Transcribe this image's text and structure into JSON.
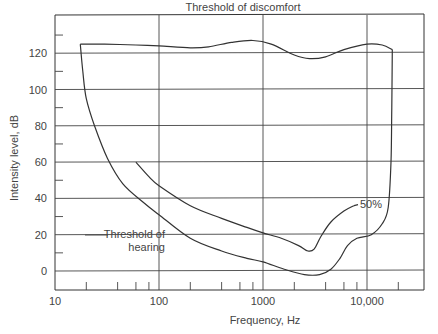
{
  "chart_data": {
    "type": "line",
    "title": "",
    "xlabel": "Frequency, Hz",
    "ylabel": "Intensity level, dB",
    "xscale": "log",
    "xlim": [
      10,
      35000
    ],
    "ylim": [
      -10,
      140
    ],
    "grid": true,
    "x_ticks": [
      {
        "value": 10,
        "label": "10"
      },
      {
        "value": 100,
        "label": "100"
      },
      {
        "value": 1000,
        "label": "1000"
      },
      {
        "value": 10000,
        "label": "10,000"
      }
    ],
    "x_minor_ticks": [
      20,
      40,
      60,
      80,
      200,
      400,
      600,
      800,
      2000,
      4000,
      6000,
      8000,
      20000
    ],
    "y_ticks": [
      {
        "value": 0,
        "label": "0"
      },
      {
        "value": 20,
        "label": "20"
      },
      {
        "value": 40,
        "label": "40"
      },
      {
        "value": 60,
        "label": "60"
      },
      {
        "value": 80,
        "label": "80"
      },
      {
        "value": 100,
        "label": "100"
      },
      {
        "value": 120,
        "label": "120"
      }
    ],
    "y_minor_ticks": [
      10,
      30,
      50,
      70,
      90,
      110,
      130
    ],
    "series": [
      {
        "name": "Threshold of discomfort",
        "points": [
          [
            17.5,
            125
          ],
          [
            30,
            125
          ],
          [
            60,
            124.5
          ],
          [
            100,
            124
          ],
          [
            200,
            123
          ],
          [
            300,
            123.5
          ],
          [
            500,
            126
          ],
          [
            800,
            127
          ],
          [
            1200,
            125
          ],
          [
            2000,
            119
          ],
          [
            2800,
            117
          ],
          [
            4000,
            118
          ],
          [
            6000,
            122
          ],
          [
            10000,
            125
          ],
          [
            14000,
            124.5
          ],
          [
            17500,
            122
          ]
        ]
      },
      {
        "name": "Threshold of hearing",
        "points": [
          [
            17.5,
            125
          ],
          [
            18.5,
            110
          ],
          [
            20,
            95
          ],
          [
            24,
            80
          ],
          [
            32,
            62
          ],
          [
            45,
            48
          ],
          [
            70,
            38
          ],
          [
            100,
            31
          ],
          [
            200,
            18
          ],
          [
            400,
            11
          ],
          [
            700,
            7
          ],
          [
            1000,
            5
          ],
          [
            1600,
            1
          ],
          [
            2500,
            -2
          ],
          [
            3500,
            -2
          ],
          [
            4500,
            1
          ],
          [
            5500,
            7
          ],
          [
            6500,
            14
          ],
          [
            8000,
            18
          ],
          [
            11000,
            20
          ],
          [
            14000,
            26
          ],
          [
            16000,
            35
          ],
          [
            17000,
            60
          ],
          [
            17300,
            90
          ],
          [
            17500,
            122
          ]
        ]
      },
      {
        "name": "50%",
        "points": [
          [
            60,
            60
          ],
          [
            80,
            52
          ],
          [
            100,
            47
          ],
          [
            200,
            36
          ],
          [
            400,
            29
          ],
          [
            700,
            24
          ],
          [
            1000,
            21
          ],
          [
            1500,
            18
          ],
          [
            2200,
            14
          ],
          [
            2700,
            11
          ],
          [
            3100,
            12
          ],
          [
            3600,
            19
          ],
          [
            4500,
            27
          ],
          [
            6000,
            33
          ],
          [
            7500,
            36
          ]
        ]
      }
    ],
    "annotations": [
      {
        "text": "Threshold of discomfort",
        "near": "top-center"
      },
      {
        "text": "Threshold of",
        "near": "threshold-of-hearing-curve"
      },
      {
        "text": "hearing",
        "near": "threshold-of-hearing-curve"
      },
      {
        "text": "50%",
        "near": "end-of-50%-curve"
      }
    ]
  }
}
